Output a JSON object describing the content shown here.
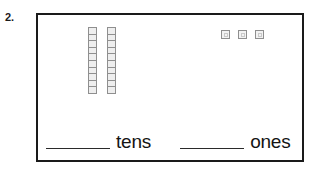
{
  "item": {
    "number": "2."
  },
  "blocks": {
    "rods": [
      {
        "name": "ten-rod",
        "cells": 10
      },
      {
        "name": "ten-rod",
        "cells": 10
      }
    ],
    "rod_count": 2,
    "cells_per_rod": 10,
    "units": [
      {
        "name": "unit-cube"
      },
      {
        "name": "unit-cube"
      },
      {
        "name": "unit-cube"
      }
    ],
    "unit_count": 3,
    "rod_fill_color": "#eeeeee",
    "rod_border_color": "#8f8f8f",
    "unit_fill_color": "#f2f2f2",
    "unit_border_color": "#8f8f8f"
  },
  "answers": {
    "tens": {
      "value": "",
      "placeholder": "",
      "label": "tens"
    },
    "ones": {
      "value": "",
      "placeholder": "",
      "label": "ones"
    }
  },
  "style": {
    "box_border_color": "#1a1a1a",
    "text_color": "#141414",
    "blank_line_color": "#2a2a2a",
    "background": "#ffffff"
  }
}
